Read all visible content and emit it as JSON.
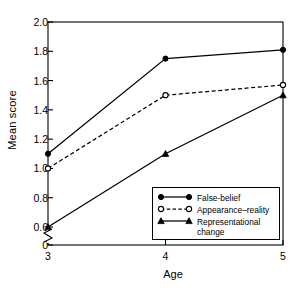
{
  "chart_data": {
    "type": "line",
    "title": "",
    "xlabel": "Age",
    "ylabel": "Mean score",
    "categories": [
      "3",
      "4",
      "5"
    ],
    "x": [
      3,
      4,
      5
    ],
    "xlim": [
      3,
      5
    ],
    "ylim": [
      0,
      2.0
    ],
    "y_ticks": [
      "0",
      "0.6",
      "0.8",
      "1.0",
      "1.2",
      "1.4",
      "1.6",
      "1.8",
      "2.0"
    ],
    "y_tick_values": [
      0,
      0.6,
      0.8,
      1.0,
      1.2,
      1.4,
      1.6,
      1.8,
      2.0
    ],
    "x_ticks": [
      "3",
      "4",
      "5"
    ],
    "axis_break": true,
    "axis_break_between": [
      0,
      0.6
    ],
    "grid": false,
    "legend_position": "inside-lower-right",
    "frame": "box",
    "series": [
      {
        "name": "False-belief",
        "marker": "filled-circle",
        "line": "solid",
        "color": "#000000",
        "values": [
          1.1,
          1.75,
          1.81
        ]
      },
      {
        "name": "Appearance–reality",
        "marker": "open-circle",
        "line": "dashed",
        "color": "#000000",
        "values": [
          1.0,
          1.5,
          1.57
        ]
      },
      {
        "name": "Representational change",
        "marker": "filled-triangle",
        "line": "solid",
        "color": "#000000",
        "values": [
          0.6,
          1.1,
          1.5
        ]
      }
    ]
  },
  "legend": {
    "entries": [
      {
        "label": "False-belief"
      },
      {
        "label": "Appearance–reality"
      },
      {
        "label": "Representational"
      },
      {
        "label": "change"
      }
    ]
  }
}
